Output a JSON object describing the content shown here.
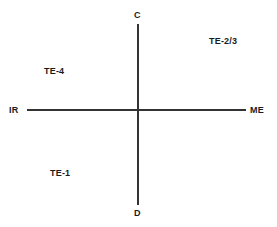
{
  "chart_data": {
    "type": "scatter",
    "title": "",
    "xlabel": "",
    "ylabel": "",
    "grid": false,
    "legend": null,
    "axes": {
      "vertical": {
        "top_label": "C",
        "bottom_label": "D"
      },
      "horizontal": {
        "left_label": "IR",
        "right_label": "ME"
      }
    },
    "quadrant_labels": [
      {
        "text": "TE-2/3",
        "quadrant": "upper-right"
      },
      {
        "text": "TE-4",
        "quadrant": "upper-left"
      },
      {
        "text": "TE-1",
        "quadrant": "lower-left"
      }
    ],
    "series": [],
    "colors": {
      "axis": "#333333",
      "text": "#1a1a1a",
      "background": "#ffffff"
    }
  },
  "diagram": {
    "axis_labels": {
      "top": "C",
      "bottom": "D",
      "left": "IR",
      "right": "ME"
    },
    "quadrants": {
      "upper_right": "TE-2/3",
      "upper_left": "TE-4",
      "lower_left": "TE-1"
    }
  }
}
